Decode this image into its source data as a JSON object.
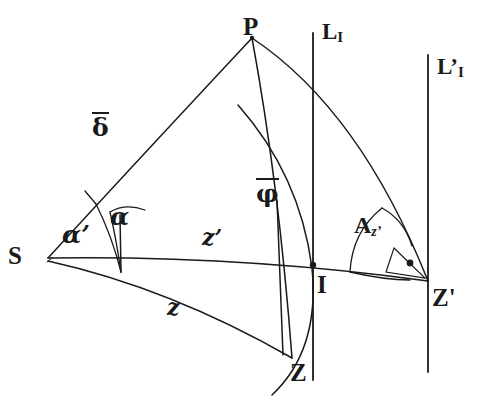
{
  "figure": {
    "type": "geometry-diagram",
    "background_color": "#ffffff",
    "stroke_color": "#1a1a1a"
  },
  "points": [
    {
      "key": "P",
      "label": "P",
      "x": 252,
      "y": 38,
      "label_x": 243,
      "label_y": 14
    },
    {
      "key": "S",
      "label": "S",
      "x": 48,
      "y": 258,
      "label_x": 8,
      "label_y": 243
    },
    {
      "key": "Z",
      "label": "Z",
      "x": 292,
      "y": 358,
      "label_x": 290,
      "label_y": 360
    },
    {
      "key": "I",
      "label": "I",
      "x": 313,
      "y": 265,
      "label_x": 317,
      "label_y": 272
    },
    {
      "key": "Zp",
      "label": "Z'",
      "x": 428,
      "y": 281,
      "label_x": 432,
      "label_y": 285
    }
  ],
  "vertical_lines": [
    {
      "key": "LI",
      "label": "L",
      "subscript": "I",
      "x": 313,
      "y_top": 33,
      "y_bottom": 380,
      "label_x": 322,
      "label_y": 20
    },
    {
      "key": "LpI",
      "label": "L’",
      "subscript": "I",
      "x": 428,
      "y_top": 55,
      "y_bottom": 372,
      "label_x": 437,
      "label_y": 55
    }
  ],
  "arc_labels": [
    {
      "key": "delta",
      "text": "δ",
      "overbar": true,
      "x": 92,
      "y": 112,
      "style": "greek"
    },
    {
      "key": "phi",
      "text": "φ",
      "overbar": true,
      "x": 256,
      "y": 178,
      "style": "greek"
    },
    {
      "key": "zprime",
      "text": "z’",
      "overbar": false,
      "x": 202,
      "y": 226,
      "style": "arc"
    },
    {
      "key": "z",
      "text": "z",
      "overbar": false,
      "x": 167,
      "y": 296,
      "style": "arc"
    }
  ],
  "angle_labels": [
    {
      "key": "alpha_prime",
      "text": "α’",
      "x": 62,
      "y": 222,
      "style": "greek-italic"
    },
    {
      "key": "alpha",
      "text": "α",
      "x": 110,
      "y": 204,
      "style": "greek-italic"
    },
    {
      "key": "azimuth",
      "text": "A",
      "subscript": "z’",
      "x": 354,
      "y": 213,
      "style": "az"
    }
  ],
  "right_angle_marker": {
    "key": "right-angle-dot",
    "x": 410,
    "y": 263
  }
}
